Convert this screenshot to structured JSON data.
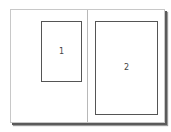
{
  "diagram": {
    "type": "page-spread-layout",
    "pages": [
      {
        "id": "left-page"
      },
      {
        "id": "right-page"
      }
    ],
    "frames": [
      {
        "label": "1",
        "page": "left-page"
      },
      {
        "label": "2",
        "page": "right-page"
      }
    ],
    "colors": {
      "background": "#ffffff",
      "frame_border": "#555555",
      "page_border": "#c8c8c8",
      "shadow": "#5a5a5a",
      "label": "#444444"
    }
  }
}
